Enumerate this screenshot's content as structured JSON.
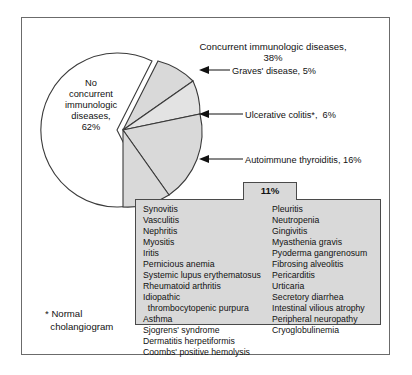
{
  "chart_data": {
    "type": "pie",
    "title": "Concurrent immunologic diseases, 38%",
    "categories": [
      "No concurrent immunologic diseases",
      "Graves' disease",
      "Ulcerative colitis*",
      "Autoimmune thyroiditis",
      "Other concurrent immunologic diseases"
    ],
    "values": [
      62,
      5,
      6,
      16,
      11
    ],
    "value_labels": [
      "62%",
      "5%",
      "6%",
      "16%",
      "11%"
    ],
    "exploded": [
      "Graves' disease",
      "Ulcerative colitis*",
      "Autoimmune thyroiditis",
      "Other concurrent immunologic diseases"
    ],
    "legend": "none",
    "grid": false,
    "xlabel": "",
    "ylabel": ""
  },
  "pie": {
    "center_label": "No\nconcurrent\nimmunologic\ndiseases,\n62%",
    "title": "Concurrent immunologic diseases,\n38%",
    "callouts": [
      {
        "label": "Graves' disease, 5%"
      },
      {
        "label": "Ulcerative colitis*,  6%"
      },
      {
        "label": "Autoimmune thyroiditis, 16%"
      }
    ],
    "other_percent": "11%"
  },
  "disease_list": {
    "left_column": [
      "Synovitis",
      "Vasculitis",
      "Nephritis",
      "Myositis",
      "Iritis",
      "Pernicious anemia",
      "Systemic lupus erythematosus",
      "Rheumatoid arthritis",
      "Idiopathic",
      "  thrombocytopenic purpura",
      "Asthma",
      "Sjogrens' syndrome",
      "Dermatitis herpetiformis",
      "Coombs' positive hemolysis"
    ],
    "right_column": [
      "Pleuritis",
      "Neutropenia",
      "Gingivitis",
      "Myasthenia gravis",
      "Pyoderma gangrenosum",
      "Fibrosing alveolitis",
      "Pericarditis",
      "Urticaria",
      "Secretory diarrhea",
      "Intestinal vilious atrophy",
      "Peripheral neuropathy",
      "Cryoglobulinemia"
    ]
  },
  "footnote": "* Normal\n  cholangiogram",
  "colors": {
    "frame": "#6b6b6b",
    "wedge_fill": "#d9d9d9",
    "wedge_stroke": "#3a3a3a",
    "box_fill": "#d9d9d9",
    "box_stroke": "#4a4a4a"
  }
}
